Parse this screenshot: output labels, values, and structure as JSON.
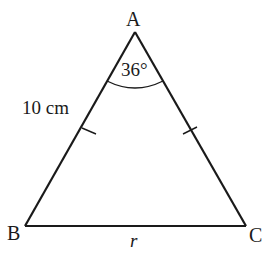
{
  "diagram": {
    "type": "isosceles-triangle",
    "vertices": {
      "A": {
        "label": "A",
        "x": 135,
        "y": 32
      },
      "B": {
        "label": "B",
        "x": 25,
        "y": 226
      },
      "C": {
        "label": "C",
        "x": 246,
        "y": 226
      }
    },
    "angle_label": "36°",
    "side_label": "10 cm",
    "base_label": "r",
    "stroke_color": "#1a1a1a"
  }
}
